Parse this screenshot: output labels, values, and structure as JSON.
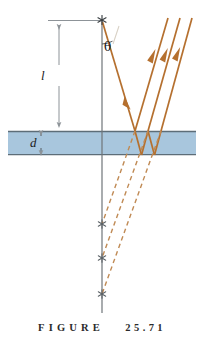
{
  "figure": {
    "caption_word": "FIGURE",
    "caption_number": "25.71",
    "labels": {
      "distance_above_slab": "l",
      "slab_thickness": "d",
      "incidence_angle": "θ"
    },
    "colors": {
      "slab_fill": "#a8c6dd",
      "slab_edge": "#5d6d78",
      "ray": "#b5702f",
      "ray_dashed": "#c08a54",
      "axis_line": "#6f7579",
      "dimension_line": "#8d9398",
      "source_mark": "#3a3f43",
      "background": "#ffffff",
      "caption_text": "#2b2b2b"
    },
    "geometry": {
      "slab": {
        "x": 8,
        "y": 131,
        "width": 188,
        "height": 24
      },
      "normal_axis": {
        "x": 102,
        "y_top": 20,
        "y_bottom": 313
      },
      "source_point": {
        "x": 102,
        "y": 20
      },
      "virtual_images": [
        {
          "x": 102,
          "y": 224
        },
        {
          "x": 102,
          "y": 258
        },
        {
          "x": 102,
          "y": 294
        }
      ],
      "outgoing_rays": [
        {
          "x_top": 168,
          "y_top": 18
        },
        {
          "x_top": 180,
          "y_top": 18
        },
        {
          "x_top": 192,
          "y_top": 18
        }
      ],
      "dimension_l": {
        "x": 59,
        "y_top": 20,
        "y_bottom": 131
      },
      "dimension_d": {
        "x": 41,
        "y_top": 131,
        "y_bottom": 155
      }
    },
    "elements": {
      "point_source_name": "point-source-asterisk",
      "virtual_image_name": "virtual-image-asterisk",
      "slab_name": "glass-slab",
      "incident_ray_name": "incident-ray",
      "reflected_rays_name": "emerging-parallel-rays",
      "dashed_rays_name": "virtual-ray-extensions"
    }
  }
}
